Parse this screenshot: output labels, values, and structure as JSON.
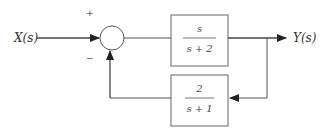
{
  "diagram": {
    "type": "block-diagram",
    "input": {
      "label": "X(s)"
    },
    "output": {
      "label": "Y(s)"
    },
    "summing_junction": {
      "signs": {
        "top": "+",
        "bottom": "−"
      }
    },
    "forward_block": {
      "numerator": "s",
      "denominator": "s + 2"
    },
    "feedback_block": {
      "numerator": "2",
      "denominator": "s + 1"
    },
    "colors": {
      "line": "#444444",
      "box": "#555555"
    }
  }
}
